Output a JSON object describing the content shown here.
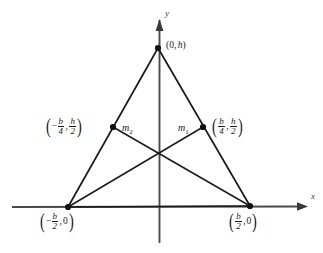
{
  "figure": {
    "background_color": "#ffffff",
    "line_color": "#1a1a1a",
    "axes": {
      "x_label": "x",
      "y_label": "y",
      "origin_px": [
        159,
        207
      ]
    },
    "points": {
      "apex": {
        "name": "apex-vertex",
        "label_text": "(0, h)",
        "x_value": "0",
        "y_value": "h",
        "px": [
          158,
          48
        ]
      },
      "bottom_left": {
        "name": "bottom-left-vertex",
        "label_text": "(-b/2, 0)",
        "x_numer": "b",
        "x_denom": "2",
        "x_sign": "−",
        "y_value": "0",
        "px": [
          68,
          207
        ]
      },
      "bottom_right": {
        "name": "bottom-right-vertex",
        "label_text": "(b/2, 0)",
        "x_numer": "b",
        "x_denom": "2",
        "x_sign": "",
        "y_value": "0",
        "px": [
          250,
          206
        ]
      },
      "left_midpoint": {
        "name": "left-side-midpoint",
        "label_text": "(-b/4, h/2)",
        "x_numer": "b",
        "x_denom": "4",
        "x_sign": "−",
        "y_numer": "h",
        "y_denom": "2",
        "px": [
          113,
          127
        ]
      },
      "right_midpoint": {
        "name": "right-side-midpoint",
        "label_text": "(b/4, h/2)",
        "x_numer": "b",
        "x_denom": "4",
        "x_sign": "",
        "y_numer": "h",
        "y_denom": "2",
        "px": [
          203,
          127
        ]
      },
      "centroid": {
        "name": "centroid",
        "px": [
          159,
          155
        ]
      }
    },
    "medians": {
      "m1": {
        "name": "median-m1",
        "label_base": "m",
        "label_sub": "1",
        "from": "bottom_left",
        "to": "right_midpoint"
      },
      "m2": {
        "name": "median-m2",
        "label_base": "m",
        "label_sub": "2",
        "from": "bottom_right",
        "to": "left_midpoint"
      }
    },
    "comma": ","
  }
}
